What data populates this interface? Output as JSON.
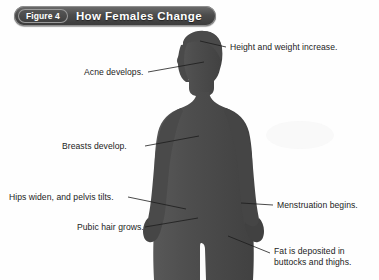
{
  "figure": {
    "number_label": "Figure 4",
    "title": "How Females Change"
  },
  "colors": {
    "silhouette": "#4e4e4e",
    "background": "#fefefe",
    "title_bar": "#454545",
    "leader_line": "#1c1c1c",
    "label_text": "#1c1c1c"
  },
  "illustration": {
    "subject": "female-body-silhouette",
    "description": "Dark gray silhouette of a female figure shown from the thighs up, facing the viewer, arms at the sides, long hair."
  },
  "callouts": {
    "left": [
      {
        "id": "acne",
        "text": "Acne develops.",
        "leader_from": {
          "x": 148,
          "y": 72
        },
        "leader_to": {
          "x": 202,
          "y": 65
        }
      },
      {
        "id": "breasts",
        "text": "Breasts develop.",
        "leader_from": {
          "x": 145,
          "y": 146
        },
        "leader_to": {
          "x": 196,
          "y": 138
        }
      },
      {
        "id": "hips",
        "text": "Hips widen, and pelvis tilts.",
        "leader_from": {
          "x": 128,
          "y": 197
        },
        "leader_to": {
          "x": 178,
          "y": 207
        }
      },
      {
        "id": "pubic-hair",
        "text": "Pubic hair grows.",
        "leader_from": {
          "x": 145,
          "y": 227
        },
        "leader_to": {
          "x": 196,
          "y": 220
        }
      }
    ],
    "right": [
      {
        "id": "height-weight",
        "text": "Height and weight increase.",
        "leader_from": {
          "x": 226,
          "y": 47
        },
        "leader_to": {
          "x": 201,
          "y": 41
        }
      },
      {
        "id": "menstruation",
        "text": "Menstruation begins.",
        "leader_from": {
          "x": 273,
          "y": 205
        },
        "leader_to": {
          "x": 243,
          "y": 203
        }
      },
      {
        "id": "fat-deposits",
        "text": "Fat is deposited in\nbuttocks and thighs.",
        "leader_from": {
          "x": 270,
          "y": 253
        },
        "leader_to": {
          "x": 230,
          "y": 238
        }
      }
    ]
  }
}
